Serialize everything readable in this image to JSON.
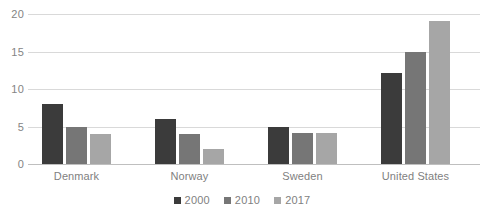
{
  "chart_data": {
    "type": "bar",
    "title": "",
    "xlabel": "",
    "ylabel": "",
    "categories": [
      "Denmark",
      "Norway",
      "Sweden",
      "United States"
    ],
    "series": [
      {
        "name": "2000",
        "color": "#3b3b3b",
        "values": [
          8,
          6,
          5,
          12.1
        ]
      },
      {
        "name": "2010",
        "color": "#767676",
        "values": [
          5,
          4,
          4.1,
          15
        ]
      },
      {
        "name": "2017",
        "color": "#a6a6a6",
        "values": [
          4,
          2,
          4.1,
          19.1
        ]
      }
    ],
    "ylim": [
      0,
      20
    ],
    "yticks": [
      0,
      5,
      10,
      15,
      20
    ],
    "ytick_labels": [
      "0",
      "5",
      "10",
      "15",
      "20"
    ],
    "grid": true,
    "legend_position": "bottom",
    "axis_color": "#bfbfbf",
    "grid_color": "#d9d9d9",
    "tick_label_color": "#7f7f7f"
  }
}
